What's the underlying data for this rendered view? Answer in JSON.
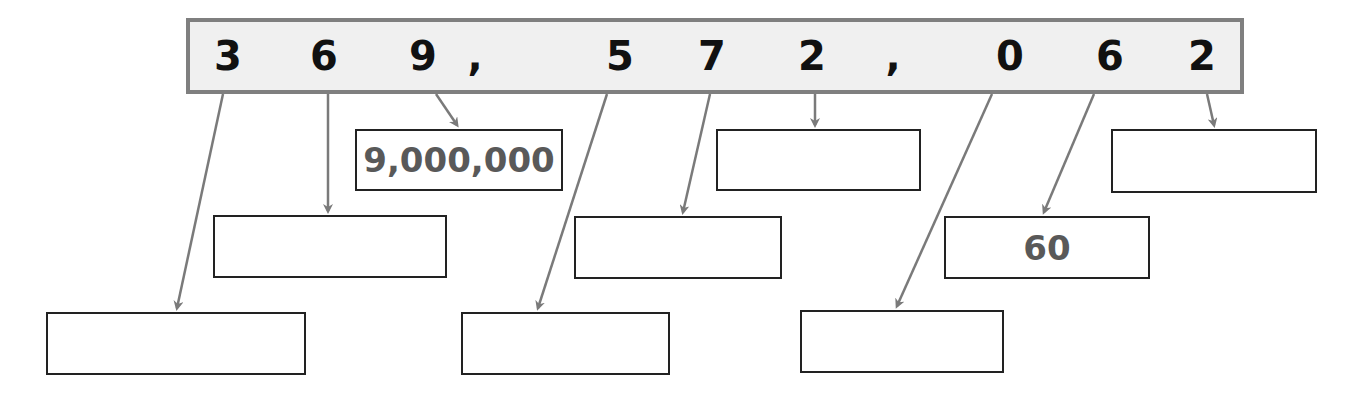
{
  "number": {
    "display": "369,572,062",
    "characters": [
      {
        "char": "3",
        "x": 228
      },
      {
        "char": "6",
        "x": 324
      },
      {
        "char": "9",
        "x": 423
      },
      {
        "char": ",",
        "x": 475
      },
      {
        "char": "5",
        "x": 620
      },
      {
        "char": "7",
        "x": 712
      },
      {
        "char": "2",
        "x": 812
      },
      {
        "char": ",",
        "x": 893
      },
      {
        "char": "0",
        "x": 1010
      },
      {
        "char": "6",
        "x": 1110
      },
      {
        "char": "2",
        "x": 1202
      }
    ]
  },
  "boxes": [
    {
      "digit": "3",
      "value": "",
      "from": [
        223,
        94
      ],
      "to": [
        177,
        308
      ],
      "rect": [
        46,
        312,
        260,
        63
      ]
    },
    {
      "digit": "6",
      "value": "",
      "from": [
        328,
        94
      ],
      "to": [
        328,
        211
      ],
      "rect": [
        213,
        215,
        234,
        63
      ]
    },
    {
      "digit": "9",
      "value": "9,000,000",
      "from": [
        436,
        94
      ],
      "to": [
        457,
        125
      ],
      "rect": [
        355,
        129,
        208,
        62
      ]
    },
    {
      "digit": "5",
      "value": "",
      "from": [
        607,
        94
      ],
      "to": [
        538,
        308
      ],
      "rect": [
        461,
        312,
        209,
        63
      ]
    },
    {
      "digit": "7",
      "value": "",
      "from": [
        710,
        94
      ],
      "to": [
        683,
        212
      ],
      "rect": [
        574,
        216,
        208,
        63
      ]
    },
    {
      "digit": "2",
      "value": "",
      "from": [
        815,
        94
      ],
      "to": [
        815,
        125
      ],
      "rect": [
        716,
        129,
        205,
        62
      ]
    },
    {
      "digit": "0",
      "value": "",
      "from": [
        992,
        94
      ],
      "to": [
        897,
        306
      ],
      "rect": [
        800,
        310,
        204,
        63
      ]
    },
    {
      "digit": "6",
      "value": "60",
      "from": [
        1094,
        94
      ],
      "to": [
        1044,
        212
      ],
      "rect": [
        944,
        216,
        206,
        63
      ]
    },
    {
      "digit": "2",
      "value": "",
      "from": [
        1207,
        94
      ],
      "to": [
        1214,
        125
      ],
      "rect": [
        1111,
        129,
        206,
        64
      ]
    }
  ],
  "colors": {
    "bar_fill": "#f0f0f0",
    "bar_border": "#7f7f7f",
    "arrow": "#7a7a7a",
    "digit_text": "#111111",
    "answer_text": "#595959",
    "box_border": "#222222"
  }
}
